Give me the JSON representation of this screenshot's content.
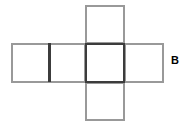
{
  "figure": {
    "type": "geometric-net",
    "shape_name": "cross-shaped cube net",
    "background_color": "#ffffff",
    "square_count": 5,
    "square_size_px": 39,
    "line_color_light": "#999999",
    "line_color_dark": "#3c3c3c",
    "line_width_light_px": 1.6,
    "line_width_dark_px": 2.2
  },
  "labels": {
    "b": "B"
  },
  "geometry": {
    "origin": {
      "x": 11,
      "y": 5
    },
    "cell": 39,
    "squares": [
      {
        "name": "top-square",
        "col": 2,
        "row": 0,
        "x": 85,
        "y": 5,
        "w": 39,
        "h": 38,
        "emphasis": "light"
      },
      {
        "name": "left-square",
        "col": 0,
        "row": 1,
        "x": 11,
        "y": 43,
        "w": 38,
        "h": 39,
        "emphasis": "light"
      },
      {
        "name": "midleft-square",
        "col": 1,
        "row": 1,
        "x": 49,
        "y": 43,
        "w": 36,
        "h": 39,
        "emphasis": "light"
      },
      {
        "name": "center-square",
        "col": 2,
        "row": 1,
        "x": 85,
        "y": 43,
        "w": 39,
        "h": 39,
        "emphasis": "dark"
      },
      {
        "name": "right-square",
        "col": 3,
        "row": 1,
        "x": 124,
        "y": 43,
        "w": 39,
        "h": 39,
        "emphasis": "light"
      },
      {
        "name": "bottom-square",
        "col": 2,
        "row": 2,
        "x": 85,
        "y": 82,
        "w": 39,
        "h": 38,
        "emphasis": "light"
      }
    ],
    "divider_line": {
      "name": "left-arm-divider",
      "x": 49,
      "y1": 43,
      "y2": 82,
      "emphasis": "dark"
    }
  }
}
